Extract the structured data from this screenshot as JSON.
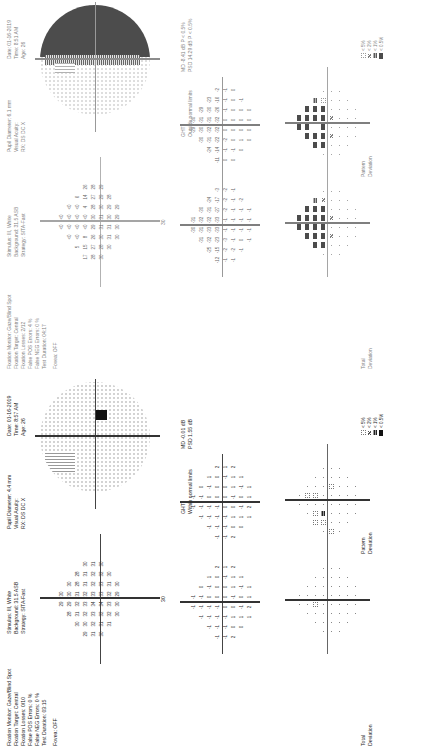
{
  "reports": [
    {
      "id": "bottom",
      "header": {
        "fixation_monitor": "Fixation Monitor: Gaze/Blind Spot",
        "fixation_target": "Fixation Target: Central",
        "fixation_losses": "Fixation Losses: 0/10",
        "false_pos": "False POS Errors: 0 %",
        "false_neg": "False NEG Errors: 0 %",
        "test_duration": "Test Duration: 03:15",
        "fovea": "Fovea: OFF",
        "stimulus": "Stimulus: III, White",
        "background": "Background: 31.5 ASB",
        "strategy": "Strategy: SITA-Fast",
        "pupil": "Pupil Diameter: 4.4 mm",
        "visual_acuity": "Visual Acuity:",
        "rx": "RX:   DS      DC X",
        "date": "Date: 01-16-2019",
        "time": "Time: 8:57 AM",
        "age": "Age: 26"
      },
      "threshold_axis_label": "30",
      "threshold_values": [
        [
          "",
          "",
          "",
          "29",
          "30",
          "",
          "",
          ""
        ],
        [
          "",
          "",
          "28",
          "29",
          "30",
          "30",
          "",
          ""
        ],
        [
          "",
          "30",
          "31",
          "32",
          "31",
          "28",
          "28",
          ""
        ],
        [
          "29",
          "30",
          "32",
          "33",
          "32",
          "31",
          "31",
          "30"
        ],
        [
          "31",
          "32",
          "33",
          "34",
          "33",
          "32",
          "32",
          "31"
        ],
        [
          "30",
          "31",
          "32",
          "34",
          "33",
          "33",
          "32",
          "30"
        ],
        [
          "",
          "31",
          "32",
          "33",
          "32",
          "31",
          "30",
          ""
        ],
        [
          "",
          "",
          "30",
          "30",
          "29",
          "30",
          "",
          ""
        ],
        [
          "",
          "",
          "",
          "",
          "",
          "",
          "",
          ""
        ]
      ],
      "total_deviation_label": "Total\nDeviation",
      "total_deviation": [
        [
          "",
          "",
          "",
          "-1",
          "-1",
          "",
          "",
          ""
        ],
        [
          "",
          "",
          "-1",
          "-1",
          "-1",
          "0",
          "",
          ""
        ],
        [
          "",
          "-1",
          "-1",
          "-1",
          "0",
          "-1",
          "1",
          ""
        ],
        [
          "-1",
          "-1",
          "-1",
          "-1",
          "0",
          "0",
          "0",
          "2"
        ],
        [
          "-1",
          "-1",
          "-1",
          "0",
          "0",
          "0",
          "-1",
          "1"
        ],
        [
          "2",
          "0",
          "1",
          "0",
          "-1",
          "1",
          "1",
          "2"
        ],
        [
          "",
          "0",
          "1",
          "-1",
          "0",
          "-1",
          "1",
          ""
        ],
        [
          "",
          "",
          "1",
          "2",
          "1",
          "1",
          "",
          ""
        ]
      ],
      "pattern_deviation_label": "Pattern\nDeviation",
      "pattern_deviation": [
        [
          "",
          "",
          "",
          "-1",
          "-1",
          "",
          "",
          ""
        ],
        [
          "",
          "",
          "-1",
          "-1",
          "-1",
          "0",
          "",
          ""
        ],
        [
          "",
          "-1",
          "-1",
          "-1",
          "0",
          "-1",
          "1",
          ""
        ],
        [
          "-1",
          "-1",
          "-1",
          "-1",
          "0",
          "0",
          "0",
          "2"
        ],
        [
          "-1",
          "-1",
          "-1",
          "0",
          "0",
          "0",
          "-1",
          "1"
        ],
        [
          "2",
          "0",
          "1",
          "0",
          "-1",
          "1",
          "1",
          "2"
        ],
        [
          "",
          "0",
          "1",
          "-1",
          "0",
          "-1",
          "1",
          ""
        ],
        [
          "",
          "",
          "1",
          "2",
          "1",
          "1",
          "",
          ""
        ]
      ],
      "ght_label": "GHT",
      "ght_value": "Within normal limits",
      "md": "MD    -0.01 dB",
      "psd": "PSD    1.55 dB",
      "total_prob": [
        [
          "n",
          "n",
          "n",
          ".",
          ".",
          "n",
          "n",
          "n"
        ],
        [
          "n",
          "n",
          ".",
          ".",
          ".",
          ".",
          "n",
          "n"
        ],
        [
          "n",
          ".",
          ".",
          "p5",
          ".",
          ".",
          ".",
          "n"
        ],
        [
          ".",
          ".",
          ".",
          ".",
          ".",
          ".",
          ".",
          "."
        ],
        [
          ".",
          ".",
          ".",
          ".",
          ".",
          ".",
          ".",
          "."
        ],
        [
          ".",
          ".",
          ".",
          ".",
          ".",
          ".",
          ".",
          "."
        ],
        [
          "n",
          ".",
          ".",
          ".",
          ".",
          ".",
          ".",
          "n"
        ],
        [
          "n",
          "n",
          ".",
          ".",
          ".",
          ".",
          "n",
          "n"
        ]
      ],
      "pattern_prob": [
        [
          "n",
          "n",
          "n",
          ".",
          ".",
          "n",
          "n",
          "n"
        ],
        [
          "n",
          "n",
          ".",
          ".",
          "p5",
          ".",
          "n",
          "n"
        ],
        [
          "n",
          "p5",
          "p5",
          ".",
          "p5",
          ".",
          ".",
          "n"
        ],
        [
          ".",
          "p5",
          "p1",
          ".",
          ".",
          ".",
          ".",
          "."
        ],
        [
          "p5",
          ".",
          ".",
          ".",
          ".",
          "p5",
          ".",
          "."
        ],
        [
          ".",
          ".",
          ".",
          ".",
          ".",
          ".",
          ".",
          "."
        ],
        [
          "n",
          ".",
          ".",
          ".",
          ".",
          ".",
          ".",
          "n"
        ],
        [
          "n",
          "n",
          ".",
          ".",
          ".",
          ".",
          "n",
          "n"
        ]
      ],
      "legend": [
        "< 5%",
        "< 2%",
        "< 1%",
        "< 0.5%"
      ],
      "greyscale": "normal-with-blindspot"
    },
    {
      "id": "top",
      "header": {
        "fixation_monitor": "Fixation Monitor: Gaze/Blind Spot",
        "fixation_target": "Fixation Target: Central",
        "fixation_losses": "Fixation Losses: 2/12",
        "false_pos": "False POS Errors: 4 %",
        "false_neg": "False NEG Errors: 0 %",
        "test_duration": "Test Duration: 04:17",
        "fovea": "Fovea: OFF",
        "stimulus": "Stimulus: III, White",
        "background": "Background: 31.5 ASB",
        "strategy": "Strategy: SITA-Fast",
        "pupil": "Pupil Diameter: 6.1 mm",
        "visual_acuity": "Visual Acuity:",
        "rx": "RX:   DS      DC X",
        "date": "Date: 01-16-2019",
        "time": "Time: 8:51 AM",
        "age": "Age: 26"
      },
      "threshold_axis_label": "30",
      "threshold_values": [
        [
          "",
          "",
          "",
          "<0",
          "<0",
          "",
          "",
          ""
        ],
        [
          "",
          "",
          "<0",
          "<0",
          "<0",
          "<0",
          "",
          ""
        ],
        [
          "",
          "5",
          "<0",
          "<0",
          "<0",
          "<0",
          "6",
          ""
        ],
        [
          "17",
          "15",
          "8",
          "<0",
          "<0",
          "4",
          "14",
          "26"
        ],
        [
          "28",
          "27",
          "26",
          "29",
          "30",
          "28",
          "27",
          "28"
        ],
        [
          "30",
          "28",
          "30",
          "31",
          "31",
          "30",
          "29",
          "29"
        ],
        [
          "",
          "30",
          "31",
          "31",
          "30",
          "29",
          "28",
          ""
        ],
        [
          "",
          "",
          "30",
          "30",
          "29",
          "29",
          "",
          ""
        ],
        [
          "",
          "",
          "",
          "",
          "",
          "",
          "",
          ""
        ]
      ],
      "total_deviation_label": "Total\nDeviation",
      "total_deviation": [
        [
          "",
          "",
          "",
          "-30",
          "-31",
          "",
          "",
          ""
        ],
        [
          "",
          "",
          "-31",
          "-31",
          "-32",
          "-30",
          "",
          ""
        ],
        [
          "",
          "-25",
          "-32",
          "-33",
          "-32",
          "-31",
          "-24",
          ""
        ],
        [
          "-12",
          "-15",
          "-23",
          "-33",
          "-33",
          "-27",
          "-17",
          "-3"
        ],
        [
          "-1",
          "-2",
          "-3",
          "-1",
          "-1",
          "-2",
          "-2",
          "-2"
        ],
        [
          "-1",
          "-2",
          "-1",
          "-1",
          "-1",
          "-1",
          "-1",
          "-1"
        ],
        [
          "",
          "-1",
          "0",
          "-1",
          "-1",
          "-1",
          "-2",
          ""
        ],
        [
          "",
          "",
          "-1",
          "-1",
          "-1",
          "-1",
          "",
          ""
        ]
      ],
      "pattern_deviation_label": "Pattern\nDeviation",
      "pattern_deviation": [
        [
          "",
          "",
          "",
          "-29",
          "-30",
          "",
          "",
          ""
        ],
        [
          "",
          "",
          "-30",
          "-30",
          "-31",
          "-29",
          "",
          ""
        ],
        [
          "",
          "-24",
          "-31",
          "-32",
          "-31",
          "-30",
          "-23",
          ""
        ],
        [
          "-11",
          "-14",
          "-22",
          "-32",
          "-32",
          "-26",
          "-16",
          "-2"
        ],
        [
          "0",
          "-1",
          "-2",
          "0",
          "0",
          "-1",
          "-1",
          "-1"
        ],
        [
          "0",
          "-1",
          "0",
          "0",
          "0",
          "0",
          "0",
          "0"
        ],
        [
          "",
          "0",
          "1",
          "0",
          "0",
          "0",
          "-1",
          ""
        ],
        [
          "",
          "",
          "0",
          "0",
          "0",
          "0",
          "",
          ""
        ]
      ],
      "ght_label": "GHT",
      "ght_value": "Outside normal limits",
      "md": "MD    -8.41 dB  P < 0.5%",
      "psd": "PSD   14.29 dB  P < 0.5%",
      "total_prob": [
        [
          "n",
          "n",
          "n",
          "p05",
          "p05",
          "n",
          "n",
          "n"
        ],
        [
          "n",
          "n",
          "p05",
          "p05",
          "p05",
          "p05",
          "n",
          "n"
        ],
        [
          "n",
          "p05",
          "p05",
          "p05",
          "p05",
          "p05",
          "p1",
          ""
        ],
        [
          ".",
          "p05",
          "p05",
          "p05",
          "p05",
          "p05",
          "p2",
          "."
        ],
        [
          ".",
          ".",
          "p2",
          ".",
          "p2",
          ".",
          ".",
          "."
        ],
        [
          ".",
          ".",
          ".",
          ".",
          ".",
          ".",
          ".",
          "."
        ],
        [
          "n",
          ".",
          ".",
          ".",
          ".",
          ".",
          ".",
          "n"
        ],
        [
          "n",
          "n",
          ".",
          ".",
          ".",
          ".",
          "n",
          "n"
        ]
      ],
      "pattern_prob": [
        [
          "n",
          "n",
          "n",
          "p05",
          "p05",
          "n",
          "n",
          "n"
        ],
        [
          "n",
          "n",
          "p05",
          "p05",
          "p05",
          "p05",
          "n",
          "n"
        ],
        [
          "n",
          "p05",
          "p05",
          "",
          "p05",
          "p05",
          "p1",
          ""
        ],
        [
          ".",
          "p05",
          "p05",
          "p05",
          "p05",
          "p05",
          "p5",
          "."
        ],
        [
          ".",
          ".",
          "p2",
          ".",
          "p2",
          ".",
          ".",
          "."
        ],
        [
          ".",
          ".",
          ".",
          ".",
          ".",
          ".",
          ".",
          "."
        ],
        [
          "n",
          ".",
          ".",
          ".",
          ".",
          ".",
          ".",
          "n"
        ],
        [
          "n",
          "n",
          ".",
          ".",
          ".",
          ".",
          "n",
          "n"
        ]
      ],
      "legend": [
        "< 5%",
        "< 2%",
        "< 1%",
        "< 0.5%"
      ],
      "greyscale": "superior-defect"
    }
  ]
}
